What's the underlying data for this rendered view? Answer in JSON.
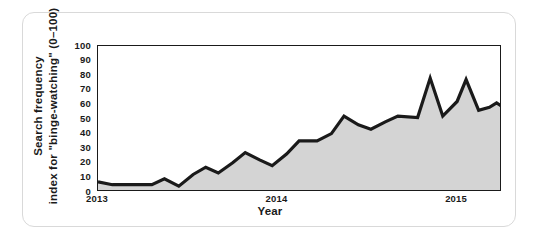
{
  "figure": {
    "y_axis_title_line1": "Search frequency",
    "y_axis_title_line2": "index for \"binge-watching\" (0–100)",
    "x_axis_title": "Year"
  },
  "chart_data": {
    "type": "area",
    "title": "",
    "xlabel": "Year",
    "ylabel": "Search frequency index for \"binge-watching\" (0-100)",
    "xlim": [
      2013.0,
      2015.25
    ],
    "ylim": [
      0,
      100
    ],
    "y_ticks": [
      0,
      10,
      20,
      30,
      40,
      50,
      60,
      70,
      80,
      90,
      100
    ],
    "x_ticks": [
      2013,
      2014,
      2015
    ],
    "x_tick_labels": [
      "2013",
      "2014",
      "2015"
    ],
    "grid": false,
    "legend": "none",
    "line_color": "#1a1a1a",
    "fill_color": "#d4d4d4",
    "series": [
      {
        "name": "Search frequency index for \"binge-watching\"",
        "x": [
          2013.0,
          2013.06,
          2013.12,
          2013.18,
          2013.25,
          2013.31,
          2013.37,
          2013.43,
          2013.5,
          2013.56,
          2013.62,
          2013.68,
          2013.75,
          2013.81,
          2013.87,
          2013.93,
          2014.0,
          2014.06,
          2014.12,
          2014.18,
          2014.25,
          2014.31,
          2014.37,
          2014.43,
          2014.5,
          2014.56,
          2014.62,
          2014.68,
          2014.75,
          2014.81,
          2014.87,
          2014.93,
          2015.0,
          2015.06,
          2015.12,
          2015.18,
          2015.25
        ],
        "values": [
          7,
          5,
          5,
          5,
          5,
          5,
          9,
          5,
          4,
          12,
          17,
          13,
          20,
          27,
          23,
          21,
          18,
          26,
          35,
          35,
          40,
          52,
          47,
          43,
          47,
          52,
          52,
          51,
          78,
          57,
          51,
          77,
          61,
          56,
          58,
          61,
          58
        ]
      }
    ],
    "series_detailed_points": [
      {
        "x": 2013.0,
        "y": 7
      },
      {
        "x": 2013.08,
        "y": 5
      },
      {
        "x": 2013.2,
        "y": 5
      },
      {
        "x": 2013.3,
        "y": 5
      },
      {
        "x": 2013.37,
        "y": 9
      },
      {
        "x": 2013.45,
        "y": 4
      },
      {
        "x": 2013.53,
        "y": 12
      },
      {
        "x": 2013.6,
        "y": 17
      },
      {
        "x": 2013.67,
        "y": 13
      },
      {
        "x": 2013.75,
        "y": 20
      },
      {
        "x": 2013.82,
        "y": 27
      },
      {
        "x": 2013.9,
        "y": 22
      },
      {
        "x": 2013.97,
        "y": 18
      },
      {
        "x": 2014.05,
        "y": 26
      },
      {
        "x": 2014.12,
        "y": 35
      },
      {
        "x": 2014.22,
        "y": 35
      },
      {
        "x": 2014.3,
        "y": 40
      },
      {
        "x": 2014.37,
        "y": 52
      },
      {
        "x": 2014.45,
        "y": 46
      },
      {
        "x": 2014.52,
        "y": 43
      },
      {
        "x": 2014.6,
        "y": 48
      },
      {
        "x": 2014.67,
        "y": 52
      },
      {
        "x": 2014.78,
        "y": 51
      },
      {
        "x": 2014.85,
        "y": 78
      },
      {
        "x": 2014.92,
        "y": 52
      },
      {
        "x": 2015.0,
        "y": 62
      },
      {
        "x": 2015.05,
        "y": 77
      },
      {
        "x": 2015.12,
        "y": 56
      },
      {
        "x": 2015.18,
        "y": 58
      },
      {
        "x": 2015.22,
        "y": 61
      },
      {
        "x": 2015.3,
        "y": 55
      },
      {
        "x": 2015.4,
        "y": 68
      },
      {
        "x": 2015.52,
        "y": 93
      },
      {
        "x": 2015.6,
        "y": 99
      },
      {
        "x": 2015.7,
        "y": 91
      },
      {
        "x": 2015.8,
        "y": 100
      }
    ]
  }
}
